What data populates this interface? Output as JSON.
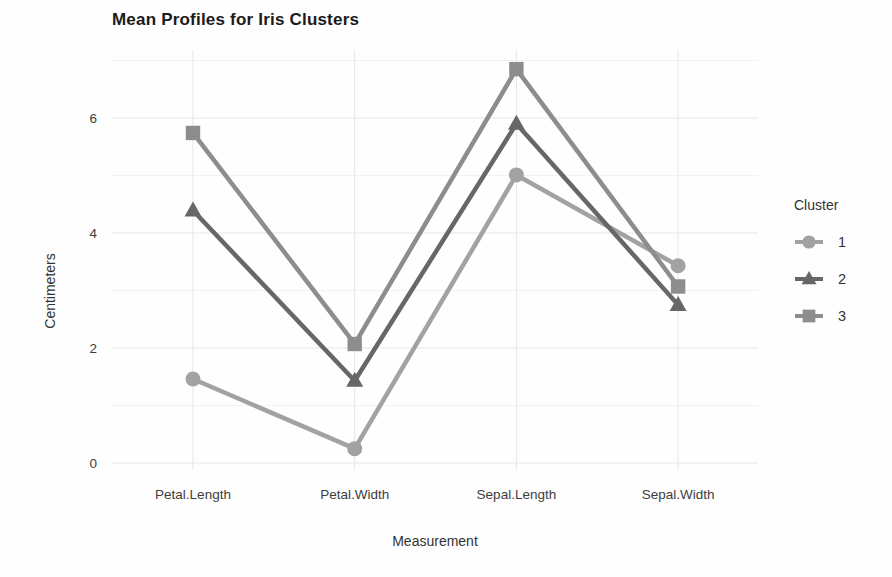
{
  "chart_data": {
    "type": "line",
    "title": "Mean Profiles for Iris Clusters",
    "xlabel": "Measurement",
    "ylabel": "Centimeters",
    "categories": [
      "Petal.Length",
      "Petal.Width",
      "Sepal.Length",
      "Sepal.Width"
    ],
    "yticks": [
      0,
      2,
      4,
      6
    ],
    "yticks_minor": [
      1,
      3,
      5,
      7
    ],
    "ylim": [
      0,
      7
    ],
    "grid": "on",
    "legend_title": "Cluster",
    "legend_position": "right",
    "colors": {
      "grid_major": "#e6e6e6",
      "grid_minor": "#f2f2f2",
      "cluster1": "#a2a2a2",
      "cluster2": "#676767",
      "cluster3": "#8d8d8d"
    },
    "series": [
      {
        "name": "1",
        "marker": "circle",
        "color": "#a2a2a2",
        "values": [
          1.46,
          0.25,
          5.01,
          3.43
        ]
      },
      {
        "name": "2",
        "marker": "triangle",
        "color": "#676767",
        "values": [
          4.39,
          1.43,
          5.9,
          2.75
        ]
      },
      {
        "name": "3",
        "marker": "square",
        "color": "#8d8d8d",
        "values": [
          5.74,
          2.07,
          6.85,
          3.07
        ]
      }
    ]
  }
}
